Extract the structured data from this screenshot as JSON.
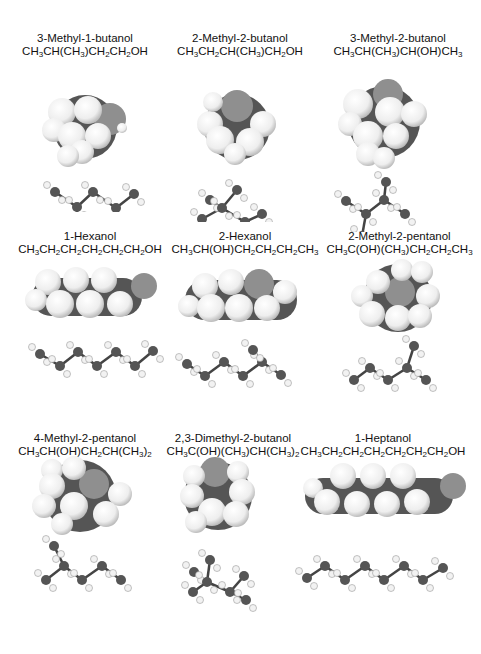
{
  "figure": {
    "colors": {
      "carbon": "#555555",
      "hydrogen": "#f2f2f2",
      "oxygen": "#8f8f8f",
      "background": "#ffffff"
    },
    "molecules": [
      {
        "name": "3-Methyl-1-butanol",
        "formula_parts": [
          "CH",
          "3",
          "CH(CH",
          "3",
          ")CH",
          "2",
          "CH",
          "2",
          "OH"
        ]
      },
      {
        "name": "2-Methyl-2-butanol",
        "formula_parts": [
          "CH",
          "3",
          "CH",
          "2",
          "CH(CH",
          "3",
          ")CH",
          "2",
          "OH"
        ]
      },
      {
        "name": "3-Methyl-2-butanol",
        "formula_parts": [
          "CH",
          "3",
          "CH(CH",
          "3",
          ")CH(OH)CH",
          "3",
          ""
        ]
      },
      {
        "name": "1-Hexanol",
        "formula_parts": [
          "CH",
          "3",
          "CH",
          "2",
          "CH",
          "2",
          "CH",
          "2",
          "CH",
          "2",
          "CH",
          "2",
          "OH"
        ]
      },
      {
        "name": "2-Hexanol",
        "formula_parts": [
          "CH",
          "3",
          "CH(OH)CH",
          "2",
          "CH",
          "2",
          "CH",
          "2",
          "CH",
          "3",
          ""
        ]
      },
      {
        "name": "2-Methyl-2-pentanol",
        "formula_parts": [
          "CH",
          "3",
          "C(OH)(CH",
          "3",
          ")CH",
          "2",
          "CH",
          "2",
          "CH",
          "3",
          ""
        ]
      },
      {
        "name": "4-Methyl-2-pentanol",
        "formula_parts": [
          "CH",
          "3",
          "CH(OH)CH",
          "2",
          "CH(CH",
          "3",
          ")",
          "2",
          ""
        ]
      },
      {
        "name": "2,3-Dimethyl-2-butanol",
        "formula_parts": [
          "CH",
          "3",
          "C(OH)(CH",
          "3",
          ")CH(CH",
          "3",
          ")",
          "2",
          ""
        ]
      },
      {
        "name": "1-Heptanol",
        "formula_parts": [
          "CH",
          "3",
          "CH",
          "2",
          "CH",
          "2",
          "CH",
          "2",
          "CH",
          "2",
          "CH",
          "2",
          "CH",
          "2",
          "OH"
        ]
      }
    ]
  }
}
